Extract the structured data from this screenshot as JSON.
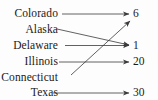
{
  "figure": {
    "type": "mapping-diagram",
    "background_color": "#fdfdfd",
    "ink_color": "#3a3a3a",
    "text_color": "#1a1a1a",
    "width": 158,
    "height": 100
  },
  "domain": {
    "name": "States",
    "items": [
      {
        "label": "Colorado",
        "y": 14
      },
      {
        "label": "Alaska",
        "y": 30
      },
      {
        "label": "Delaware",
        "y": 46
      },
      {
        "label": "Illinois",
        "y": 62
      },
      {
        "label": "Connecticut",
        "y": 78
      },
      {
        "label": "Texas",
        "y": 93
      }
    ]
  },
  "range": {
    "name": "Values",
    "items": [
      {
        "label": "6",
        "y": 14
      },
      {
        "label": "1",
        "y": 46
      },
      {
        "label": "20",
        "y": 62
      },
      {
        "label": "30",
        "y": 93
      }
    ]
  },
  "chart_data": {
    "type": "mapping",
    "title": "",
    "pairs": [
      {
        "from": "Colorado",
        "to": "6"
      },
      {
        "from": "Alaska",
        "to": "1"
      },
      {
        "from": "Delaware",
        "to": "1"
      },
      {
        "from": "Illinois",
        "to": "20"
      },
      {
        "from": "Connecticut",
        "to": "6"
      },
      {
        "from": "Texas",
        "to": "30"
      }
    ]
  },
  "arrows": [
    {
      "name": "arrow-colorado-to-6",
      "x1": 62,
      "y1": 14,
      "x2": 129,
      "y2": 14
    },
    {
      "name": "arrow-alaska-to-1",
      "x1": 57,
      "y1": 29,
      "x2": 129,
      "y2": 45
    },
    {
      "name": "arrow-delaware-to-1",
      "x1": 65,
      "y1": 45.5,
      "x2": 129,
      "y2": 45.5
    },
    {
      "name": "arrow-illinois-to-20",
      "x1": 59,
      "y1": 62,
      "x2": 129,
      "y2": 62
    },
    {
      "name": "arrow-connecticut-to-6",
      "x1": 71,
      "y1": 75,
      "x2": 130,
      "y2": 21
    },
    {
      "name": "arrow-texas-to-30",
      "x1": 53,
      "y1": 93,
      "x2": 129,
      "y2": 93
    }
  ]
}
